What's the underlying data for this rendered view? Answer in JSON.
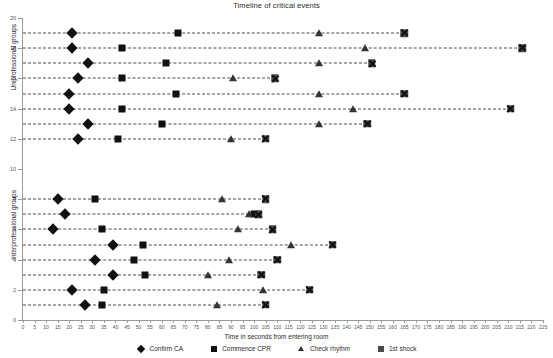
{
  "chart_data": {
    "type": "scatter",
    "title": "Timeline of critical events",
    "xlabel": "Time in seconds from entering room",
    "ylabel_top": "Uniprofessional groups",
    "ylabel_bottom": "Interprofessional groups",
    "xlim": [
      0,
      225
    ],
    "ylim": [
      0,
      20
    ],
    "xticks": [
      0,
      5,
      10,
      15,
      20,
      25,
      30,
      35,
      40,
      45,
      50,
      55,
      60,
      65,
      70,
      75,
      80,
      85,
      90,
      95,
      100,
      105,
      110,
      115,
      120,
      125,
      130,
      135,
      140,
      145,
      150,
      155,
      160,
      165,
      170,
      175,
      180,
      185,
      190,
      195,
      200,
      205,
      210,
      215,
      220,
      225
    ],
    "yticks": [
      0,
      2,
      4,
      6,
      8,
      10,
      12,
      14,
      16,
      18,
      20
    ],
    "grid": false,
    "legend_position": "below-axis",
    "series": [
      {
        "name": "Confirm CA",
        "marker": "diamond",
        "color": "#111111"
      },
      {
        "name": "Commence CPR",
        "marker": "square",
        "color": "#111111"
      },
      {
        "name": "Check rhythm",
        "marker": "triangle",
        "color": "#333333"
      },
      {
        "name": "1st shock",
        "marker": "x-box",
        "color": "#4a4a4a"
      }
    ],
    "groups": [
      {
        "label": "Uniprofessional groups",
        "rows": [
          12,
          13,
          14,
          15,
          16,
          17,
          18,
          19
        ]
      },
      {
        "label": "Interprofessional groups",
        "rows": [
          1,
          2,
          3,
          4,
          5,
          6,
          7,
          8
        ]
      }
    ],
    "rows": [
      {
        "y": 19,
        "confirm_ca": 21,
        "commence_cpr": 67,
        "check_rhythm": 128,
        "first_shock": 165
      },
      {
        "y": 18,
        "confirm_ca": 21,
        "commence_cpr": 43,
        "check_rhythm": 148,
        "first_shock": 216
      },
      {
        "y": 17,
        "confirm_ca": 28,
        "commence_cpr": 62,
        "check_rhythm": 128,
        "first_shock": 151
      },
      {
        "y": 16,
        "confirm_ca": 24,
        "commence_cpr": 43,
        "check_rhythm": 91,
        "first_shock": 109
      },
      {
        "y": 15,
        "confirm_ca": 20,
        "commence_cpr": 66,
        "check_rhythm": 128,
        "first_shock": 165
      },
      {
        "y": 14,
        "confirm_ca": 20,
        "commence_cpr": 43,
        "check_rhythm": 143,
        "first_shock": 211
      },
      {
        "y": 13,
        "confirm_ca": 28,
        "commence_cpr": 60,
        "check_rhythm": 128,
        "first_shock": 149
      },
      {
        "y": 12,
        "confirm_ca": 24,
        "commence_cpr": 41,
        "check_rhythm": 90,
        "first_shock": 105
      },
      {
        "y": 8,
        "confirm_ca": 15,
        "commence_cpr": 31,
        "check_rhythm": 86,
        "first_shock": 105
      },
      {
        "y": 7,
        "confirm_ca": 18,
        "commence_cpr": 100,
        "check_rhythm": 98,
        "first_shock": 102
      },
      {
        "y": 6,
        "confirm_ca": 13,
        "commence_cpr": 34,
        "check_rhythm": 93,
        "first_shock": 108
      },
      {
        "y": 5,
        "confirm_ca": 39,
        "commence_cpr": 52,
        "check_rhythm": 116,
        "first_shock": 134
      },
      {
        "y": 4,
        "confirm_ca": 31,
        "commence_cpr": 48,
        "check_rhythm": 89,
        "first_shock": 110
      },
      {
        "y": 3,
        "confirm_ca": 39,
        "commence_cpr": 53,
        "check_rhythm": 80,
        "first_shock": 103
      },
      {
        "y": 2,
        "confirm_ca": 21,
        "commence_cpr": 35,
        "check_rhythm": 104,
        "first_shock": 124
      },
      {
        "y": 1,
        "confirm_ca": 27,
        "commence_cpr": 34,
        "check_rhythm": 84,
        "first_shock": 105
      }
    ]
  }
}
